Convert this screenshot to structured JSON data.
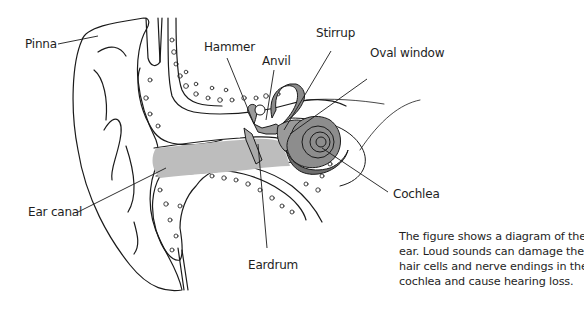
{
  "figure": {
    "title": "Diagram of the ear",
    "labels": {
      "pinna": "Pinna",
      "hammer": "Hammer",
      "anvil": "Anvil",
      "stirrup": "Stirrup",
      "oval_window": "Oval window",
      "ear_canal": "Ear canal",
      "cochlea": "Cochlea",
      "eardrum": "Eardrum"
    },
    "caption_lines": [
      "The figure shows a diagram of the",
      "ear. Loud sounds can damage the",
      "hair cells and nerve endings in the",
      "cochlea and cause hearing loss."
    ],
    "colors": {
      "ear_canal_fill": "#bdbdbd",
      "inner_ear_fill": "#9a9a9a",
      "inner_ear_dark": "#6e6e6e",
      "line": "#1a1a1a"
    }
  }
}
